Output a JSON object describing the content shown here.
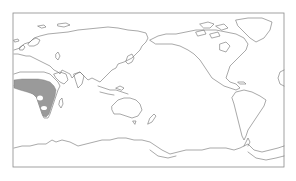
{
  "map": {
    "type": "world-outline",
    "projection": "equirectangular",
    "center_longitude": "Pacific-centered",
    "frame": {
      "x": 13,
      "y": 13,
      "width": 271,
      "height": 154
    },
    "colors": {
      "background": "#ffffff",
      "coastline": "#6e6e6e",
      "frame": "#8a8a8a",
      "shaded_region": "#9a9a9a"
    },
    "shaded_regions": [
      {
        "name": "sub-saharan-africa",
        "description": "Gray shaded distribution across tropical and southern Africa"
      }
    ],
    "landmasses": [
      "Europe",
      "Asia",
      "Africa",
      "Australia",
      "North America",
      "South America",
      "Greenland",
      "Antarctica",
      "New Zealand",
      "Madagascar"
    ]
  }
}
